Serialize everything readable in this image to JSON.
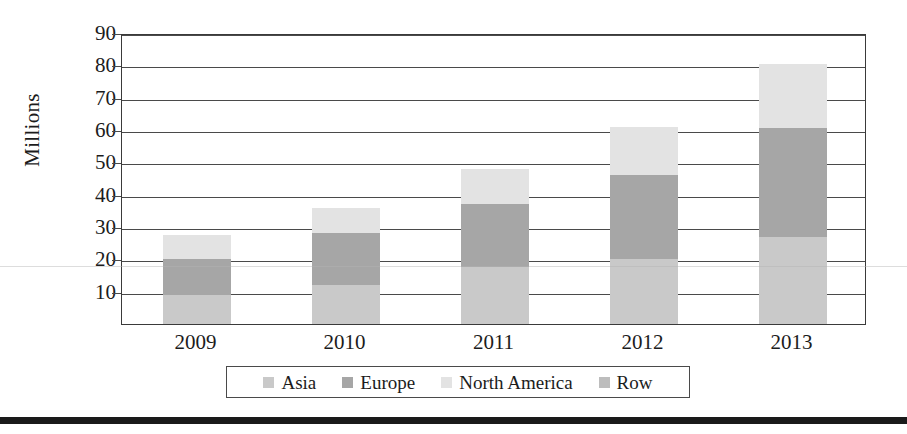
{
  "chart_data": {
    "type": "bar",
    "stacked": true,
    "title": "",
    "xlabel": "",
    "ylabel": "Millions",
    "categories": [
      "2009",
      "2010",
      "2011",
      "2012",
      "2013"
    ],
    "ylim": [
      0,
      90
    ],
    "yticks": [
      90,
      80,
      70,
      60,
      50,
      40,
      30,
      20,
      10
    ],
    "grid": true,
    "legend_position": "bottom",
    "series": [
      {
        "name": "Asia",
        "color": "#c9c9c9",
        "values": [
          9,
          12,
          17.5,
          20,
          27
        ]
      },
      {
        "name": "Europe",
        "color": "#a6a6a6",
        "values": [
          11,
          16,
          19.5,
          26,
          33.5
        ]
      },
      {
        "name": "North America",
        "color": "#e3e3e3",
        "values": [
          7.5,
          8,
          11,
          15,
          20
        ]
      },
      {
        "name": "Row",
        "color": "#bdbdbd",
        "values": [
          0,
          0,
          0,
          0,
          0
        ]
      }
    ],
    "totals": [
      27.5,
      36,
      48,
      61,
      80.5
    ]
  },
  "legend": {
    "items": [
      {
        "label": "Asia",
        "color": "#c9c9c9"
      },
      {
        "label": "Europe",
        "color": "#a6a6a6"
      },
      {
        "label": "North America",
        "color": "#e3e3e3"
      },
      {
        "label": "Row",
        "color": "#bdbdbd"
      }
    ]
  }
}
